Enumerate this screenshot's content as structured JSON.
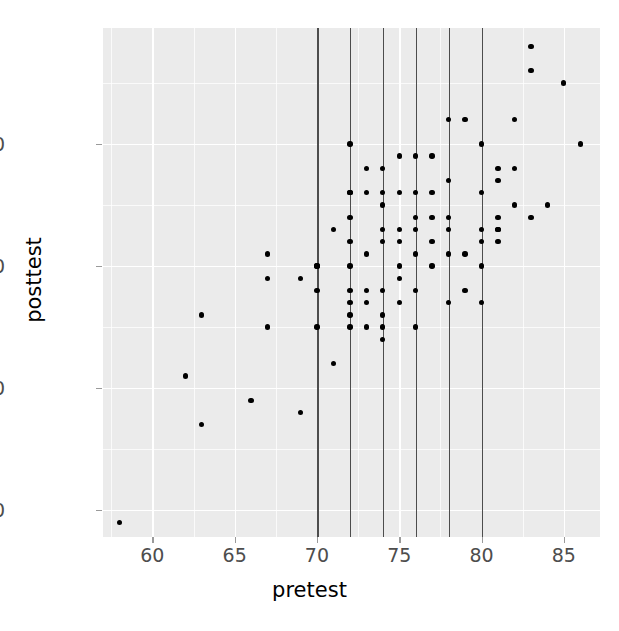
{
  "chart_data": {
    "type": "scatter",
    "title": "",
    "xlabel": "pretest",
    "ylabel": "posttest",
    "xlim": [
      57.0,
      87.2
    ],
    "ylim": [
      57.8,
      99.5
    ],
    "xticks": [
      60,
      65,
      70,
      75,
      80,
      85
    ],
    "yticks": [
      60,
      70,
      80,
      90
    ],
    "xticklabels": [
      "60",
      "65",
      "70",
      "75",
      "80",
      "85"
    ],
    "yticklabels": [
      "60",
      "70",
      "80",
      "90"
    ],
    "grid": true,
    "grid_major": true,
    "grid_minor": true,
    "legend": "none",
    "panel_background": "#ebebeb",
    "grid_color": "#ffffff",
    "point_color": "#000000",
    "point_size": 5.4,
    "vline_color": "#4d4d4d",
    "vlines": [
      70,
      72,
      74,
      76,
      78,
      80
    ],
    "x": [
      58,
      62,
      63,
      63,
      66,
      67,
      67,
      67,
      69,
      69,
      70,
      70,
      70,
      70,
      71,
      71,
      72,
      72,
      72,
      72,
      72,
      72,
      72,
      72,
      72,
      72,
      73,
      73,
      73,
      73,
      73,
      73,
      74,
      74,
      74,
      74,
      74,
      74,
      74,
      74,
      74,
      75,
      75,
      75,
      75,
      75,
      75,
      75,
      76,
      76,
      76,
      76,
      76,
      76,
      76,
      77,
      77,
      77,
      77,
      77,
      78,
      78,
      78,
      78,
      78,
      78,
      79,
      79,
      79,
      80,
      80,
      80,
      80,
      80,
      80,
      81,
      81,
      81,
      81,
      81,
      81,
      82,
      82,
      82,
      83,
      83,
      83,
      84,
      85,
      86
    ],
    "y": [
      59,
      71,
      67,
      76,
      69,
      75,
      79,
      81,
      68,
      79,
      75,
      78,
      80,
      80,
      72,
      83,
      75,
      76,
      77,
      78,
      80,
      82,
      84,
      86,
      86,
      90,
      75,
      77,
      78,
      81,
      86,
      88,
      74,
      75,
      76,
      78,
      82,
      83,
      85,
      86,
      88,
      77,
      79,
      80,
      82,
      83,
      86,
      89,
      75,
      78,
      81,
      83,
      84,
      86,
      89,
      80,
      82,
      84,
      86,
      89,
      77,
      81,
      83,
      84,
      87,
      92,
      78,
      81,
      92,
      77,
      80,
      82,
      83,
      86,
      90,
      82,
      83,
      83,
      84,
      87,
      88,
      85,
      88,
      92,
      84,
      96,
      98,
      85,
      95,
      90
    ],
    "n_points": 90
  },
  "axis": {
    "xlabel": "pretest",
    "ylabel": "posttest"
  }
}
